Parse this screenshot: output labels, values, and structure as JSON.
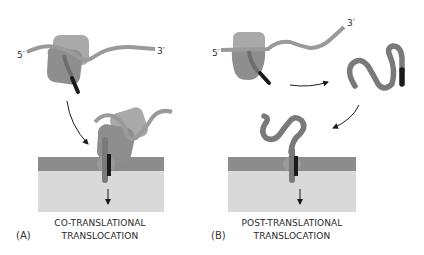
{
  "figure": {
    "panels": [
      {
        "id": "A",
        "label": "(A)",
        "caption_line1": "CO-TRANSLATIONAL",
        "caption_line2": "TRANSLOCATION",
        "mrna_5_label": "5′",
        "mrna_3_label": "3′"
      },
      {
        "id": "B",
        "label": "(B)",
        "caption_line1": "POST-TRANSLATIONAL",
        "caption_line2": "TRANSLOCATION",
        "mrna_5_label": "5′",
        "mrna_3_label": "3′"
      }
    ],
    "colors": {
      "ribosome": "#8f8f8f",
      "ribosome_light": "#a6a6a6",
      "mrna": "#9a9a9a",
      "polypeptide": "#7a7a7a",
      "signal_sequence": "#1a1a1a",
      "membrane_band": "#8c8c8c",
      "lumen": "#d9d9d9",
      "arrow": "#1a1a1a"
    }
  }
}
